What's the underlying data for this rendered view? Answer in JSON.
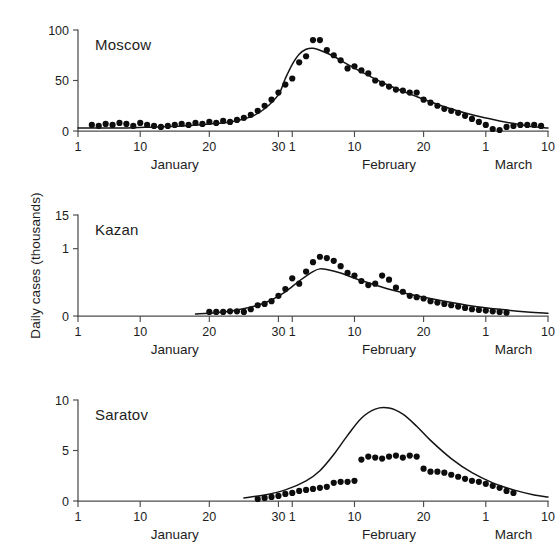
{
  "figure": {
    "y_axis_label": "Daily cases (thousands)",
    "x_months": [
      "January",
      "February",
      "March"
    ]
  },
  "chart_data": [
    {
      "type": "scatter",
      "title": "Moscow",
      "xlabel": "",
      "ylabel": "Daily cases (thousands)",
      "xlim": [
        1,
        69
      ],
      "ylim": [
        0,
        100
      ],
      "yticks": [
        0,
        50,
        100
      ],
      "ytick_labels": [
        "0",
        "50",
        "100"
      ],
      "xticks": [
        1,
        10,
        20,
        30,
        32,
        41,
        51,
        60,
        69
      ],
      "xtick_labels": [
        "1",
        "10",
        "20",
        "30",
        "1",
        "10",
        "20",
        "1",
        "10"
      ],
      "grid": false,
      "legend": "none",
      "series": [
        {
          "name": "Observed daily cases",
          "type": "scatter",
          "x": [
            3,
            4,
            5,
            6,
            7,
            8,
            9,
            10,
            11,
            12,
            13,
            14,
            15,
            16,
            17,
            18,
            19,
            20,
            21,
            22,
            23,
            24,
            25,
            26,
            27,
            28,
            29,
            30,
            31,
            32,
            33,
            34,
            35,
            36,
            37,
            38,
            39,
            40,
            41,
            42,
            43,
            44,
            45,
            46,
            47,
            48,
            49,
            50,
            51,
            52,
            53,
            54,
            55,
            56,
            57,
            58,
            59,
            60,
            61,
            62,
            63,
            64,
            65,
            66,
            67,
            68
          ],
          "y": [
            6,
            5,
            7,
            6,
            8,
            7,
            5,
            8,
            6,
            5,
            4,
            5,
            6,
            7,
            6,
            8,
            7,
            9,
            8,
            10,
            9,
            11,
            13,
            16,
            20,
            25,
            31,
            38,
            46,
            52,
            68,
            74,
            90,
            90,
            80,
            75,
            70,
            62,
            64,
            60,
            57,
            50,
            47,
            44,
            41,
            40,
            38,
            38,
            31,
            28,
            25,
            22,
            20,
            18,
            15,
            12,
            9,
            6,
            2,
            1,
            4,
            5,
            6,
            6,
            6,
            5
          ]
        },
        {
          "name": "Model fit",
          "type": "line",
          "x": [
            1,
            4,
            8,
            12,
            16,
            20,
            23,
            26,
            28,
            30,
            31,
            32,
            33,
            34,
            35,
            36,
            38,
            40,
            43,
            46,
            50,
            54,
            58,
            62,
            66,
            69
          ],
          "y": [
            3,
            3,
            3,
            4,
            5,
            7,
            9,
            14,
            22,
            36,
            52,
            66,
            76,
            81,
            82,
            80,
            74,
            66,
            55,
            45,
            34,
            24,
            16,
            10,
            5,
            3
          ]
        }
      ]
    },
    {
      "type": "scatter",
      "title": "Kazan",
      "xlabel": "",
      "ylabel": "Daily cases (thousands)",
      "xlim": [
        1,
        69
      ],
      "ylim": [
        0,
        15
      ],
      "yticks": [
        0,
        10,
        15
      ],
      "ytick_labels": [
        "0",
        "1",
        "15"
      ],
      "xticks": [
        1,
        10,
        20,
        30,
        32,
        41,
        51,
        60,
        69
      ],
      "xtick_labels": [
        "1",
        "10",
        "20",
        "30",
        "1",
        "10",
        "20",
        "1",
        "10"
      ],
      "grid": false,
      "legend": "none",
      "series": [
        {
          "name": "Observed daily cases",
          "type": "scatter",
          "x": [
            20,
            21,
            22,
            23,
            24,
            25,
            26,
            27,
            28,
            29,
            30,
            31,
            32,
            33,
            34,
            35,
            36,
            37,
            38,
            39,
            40,
            41,
            42,
            43,
            44,
            45,
            46,
            47,
            48,
            49,
            50,
            51,
            52,
            53,
            54,
            55,
            56,
            57,
            58,
            59,
            60,
            61,
            62,
            63
          ],
          "y": [
            0.6,
            0.6,
            0.6,
            0.7,
            0.7,
            0.6,
            1.0,
            1.6,
            1.8,
            2.2,
            3.0,
            4.0,
            5.6,
            4.8,
            6.6,
            8.0,
            8.8,
            8.6,
            8.2,
            7.4,
            6.4,
            6.0,
            5.2,
            4.6,
            4.8,
            6.0,
            5.4,
            4.2,
            3.6,
            3.0,
            2.8,
            2.6,
            2.2,
            2.0,
            1.8,
            1.6,
            1.4,
            1.2,
            1.0,
            0.9,
            0.8,
            0.7,
            0.6,
            0.5
          ]
        },
        {
          "name": "Model fit",
          "type": "line",
          "x": [
            18,
            21,
            24,
            27,
            29,
            31,
            33,
            35,
            36,
            37,
            39,
            41,
            44,
            47,
            50,
            54,
            58,
            62,
            66,
            69
          ],
          "y": [
            0.3,
            0.5,
            0.9,
            1.6,
            2.4,
            3.6,
            5.2,
            6.6,
            7.0,
            6.9,
            6.4,
            5.6,
            4.6,
            3.7,
            3.0,
            2.2,
            1.5,
            1.0,
            0.6,
            0.4
          ]
        }
      ]
    },
    {
      "type": "scatter",
      "title": "Saratov",
      "xlabel": "",
      "ylabel": "Daily cases (thousands)",
      "xlim": [
        1,
        69
      ],
      "ylim": [
        0,
        10
      ],
      "yticks": [
        0,
        5,
        10
      ],
      "ytick_labels": [
        "0",
        "5",
        "10"
      ],
      "xticks": [
        1,
        10,
        20,
        30,
        32,
        41,
        51,
        60,
        69
      ],
      "xtick_labels": [
        "1",
        "10",
        "20",
        "30",
        "1",
        "10",
        "20",
        "1",
        "10"
      ],
      "grid": false,
      "legend": "none",
      "series": [
        {
          "name": "Observed daily cases",
          "type": "scatter",
          "x": [
            27,
            28,
            29,
            30,
            31,
            32,
            33,
            34,
            35,
            36,
            37,
            38,
            39,
            40,
            41,
            42,
            43,
            44,
            45,
            46,
            47,
            48,
            49,
            50,
            51,
            52,
            53,
            54,
            55,
            56,
            57,
            58,
            59,
            60,
            61,
            62,
            63,
            64
          ],
          "y": [
            0.2,
            0.3,
            0.4,
            0.5,
            0.7,
            0.8,
            1.0,
            1.1,
            1.2,
            1.3,
            1.4,
            1.8,
            1.9,
            1.9,
            2.0,
            4.1,
            4.4,
            4.3,
            4.2,
            4.4,
            4.5,
            4.3,
            4.5,
            4.4,
            3.2,
            2.9,
            2.9,
            2.8,
            2.6,
            2.4,
            2.2,
            2.0,
            1.9,
            1.7,
            1.5,
            1.3,
            1.0,
            0.8
          ]
        },
        {
          "name": "Model fit",
          "type": "line",
          "x": [
            25,
            28,
            31,
            34,
            36,
            38,
            40,
            42,
            44,
            46,
            48,
            50,
            52,
            55,
            58,
            61,
            64,
            67,
            69
          ],
          "y": [
            0.3,
            0.6,
            1.1,
            2.0,
            3.0,
            4.6,
            6.5,
            8.2,
            9.1,
            9.2,
            8.6,
            7.4,
            6.0,
            4.2,
            2.8,
            1.8,
            1.1,
            0.6,
            0.4
          ]
        }
      ]
    }
  ]
}
